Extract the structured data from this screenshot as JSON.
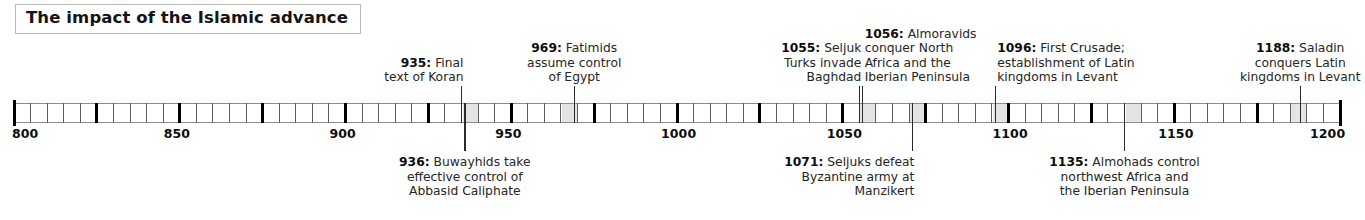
{
  "title": "The impact of the Islamic advance",
  "axis": {
    "start_year": 800,
    "end_year": 1200,
    "tick_interval": 5,
    "major_tick_interval": 25,
    "labels": [
      {
        "year": 800,
        "text": "800"
      },
      {
        "year": 850,
        "text": "850"
      },
      {
        "year": 900,
        "text": "900"
      },
      {
        "year": 950,
        "text": "950"
      },
      {
        "year": 1000,
        "text": "1000"
      },
      {
        "year": 1050,
        "text": "1050"
      },
      {
        "year": 1100,
        "text": "1100"
      },
      {
        "year": 1150,
        "text": "1150"
      },
      {
        "year": 1200,
        "text": "1200"
      }
    ]
  },
  "events": [
    {
      "year": 935,
      "side": "above",
      "align": "right",
      "year_label": "935",
      "lines": [
        "Final",
        "text of Koran"
      ],
      "text": "935: Final text of Koran"
    },
    {
      "year": 936,
      "side": "below",
      "align": "center",
      "year_label": "936",
      "lines": [
        "Buwayhids take",
        "effective control of",
        "Abbasid Caliphate"
      ],
      "text": "936: Buwayhids take effective control of Abbasid Caliphate"
    },
    {
      "year": 969,
      "side": "above",
      "align": "center",
      "year_label": "969",
      "lines": [
        "Fatimids",
        "assume control",
        "of Egypt"
      ],
      "text": "969: Fatimids assume control of Egypt"
    },
    {
      "year": 1055,
      "side": "above",
      "align": "right",
      "year_label": "1055",
      "lines": [
        "Seljuk",
        "Turks invade",
        "Baghdad"
      ],
      "text": "1055: Seljuk Turks invade Baghdad"
    },
    {
      "year": 1056,
      "side": "above",
      "align": "left",
      "year_label": "1056",
      "lines": [
        "Almoravids",
        "conquer North",
        "Africa and the",
        "Iberian Peninsula"
      ],
      "text": "1056: Almoravids conquer North Africa and the Iberian Peninsula"
    },
    {
      "year": 1071,
      "side": "below",
      "align": "right",
      "year_label": "1071",
      "lines": [
        "Seljuks defeat",
        "Byzantine army at",
        "Manzikert"
      ],
      "text": "1071: Seljuks defeat Byzantine army at Manzikert"
    },
    {
      "year": 1096,
      "side": "above",
      "align": "left",
      "year_label": "1096",
      "lines": [
        "First Crusade;",
        "establishment of Latin",
        "kingdoms in Levant"
      ],
      "text": "1096: First Crusade; establishment of Latin kingdoms in Levant"
    },
    {
      "year": 1135,
      "side": "below",
      "align": "center",
      "year_label": "1135",
      "lines": [
        "Almohads control",
        "northwest Africa and",
        "the Iberian Peninsula"
      ],
      "text": "1135: Almohads control northwest Africa and the Iberian Peninsula"
    },
    {
      "year": 1188,
      "side": "above",
      "align": "center",
      "year_label": "1188",
      "lines": [
        "Saladin",
        "conquers Latin",
        "kingdoms in Levant"
      ],
      "text": "1188: Saladin conquers Latin kingdoms in Levant"
    }
  ],
  "colors": {
    "axis_line": "#8d8d8d",
    "tick": "#000000",
    "text": "#262626",
    "title_border": "#b8b8b8",
    "cell_highlight": "#e4e4e4",
    "background": "#ffffff"
  }
}
